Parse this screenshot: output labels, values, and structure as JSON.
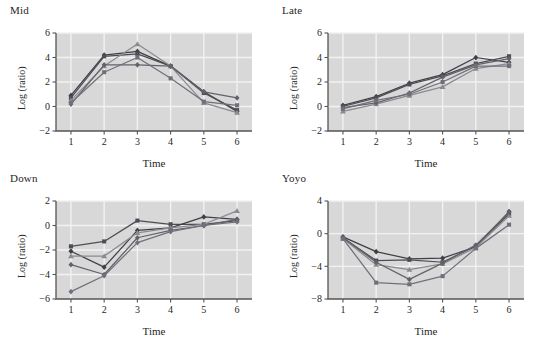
{
  "figure": {
    "background": "#ffffff",
    "plot_background": "#d8d8d8",
    "gridline_color": "#f2f2f2",
    "axis_color": "#555555",
    "text_color": "#262626"
  },
  "chart_data": [
    {
      "type": "line",
      "title": "Mid",
      "xlabel": "Time",
      "ylabel": "Log (ratio)",
      "grid": true,
      "legend": "none",
      "x": [
        1,
        2,
        3,
        4,
        5,
        6
      ],
      "xticklabels": [
        "1",
        "2",
        "3",
        "4",
        "5",
        "6"
      ],
      "yticklabels": [
        "-2",
        "0",
        "2",
        "4",
        "6"
      ],
      "yticks": [
        -2,
        0,
        2,
        4,
        6
      ],
      "xlim": [
        0.55,
        6.45
      ],
      "ylim": [
        -2,
        6
      ],
      "series": [
        {
          "name": "series-1",
          "marker": "diamond",
          "color": "#3f3f46",
          "values": [
            0.9,
            4.2,
            4.5,
            3.3,
            1.2,
            -0.4
          ]
        },
        {
          "name": "series-2",
          "marker": "square",
          "color": "#4d4d55",
          "values": [
            0.7,
            4.1,
            4.3,
            3.3,
            1.1,
            -0.3
          ]
        },
        {
          "name": "series-3",
          "marker": "triangle",
          "color": "#8a8a90",
          "values": [
            0.5,
            3.3,
            5.1,
            3.3,
            0.3,
            -0.5
          ]
        },
        {
          "name": "series-4",
          "marker": "diamond",
          "color": "#62626a",
          "values": [
            0.2,
            3.4,
            3.4,
            3.3,
            1.2,
            0.7
          ]
        },
        {
          "name": "series-5",
          "marker": "square",
          "color": "#70707a",
          "values": [
            0.3,
            2.8,
            4.0,
            2.3,
            0.4,
            0.1
          ]
        }
      ]
    },
    {
      "type": "line",
      "title": "Late",
      "xlabel": "Time",
      "ylabel": "Log (ratio)",
      "grid": true,
      "legend": "none",
      "x": [
        1,
        2,
        3,
        4,
        5,
        6
      ],
      "xticklabels": [
        "1",
        "2",
        "3",
        "4",
        "5",
        "6"
      ],
      "yticklabels": [
        "-2",
        "0",
        "2",
        "4",
        "6"
      ],
      "yticks": [
        -2,
        0,
        2,
        4,
        6
      ],
      "xlim": [
        0.55,
        6.45
      ],
      "ylim": [
        -2,
        6
      ],
      "series": [
        {
          "name": "series-1",
          "marker": "diamond",
          "color": "#3f3f46",
          "values": [
            0.1,
            0.8,
            1.9,
            2.6,
            4.0,
            3.6
          ]
        },
        {
          "name": "series-2",
          "marker": "square",
          "color": "#4d4d55",
          "values": [
            0.0,
            0.7,
            1.8,
            2.5,
            3.5,
            4.1
          ]
        },
        {
          "name": "series-3",
          "marker": "triangle",
          "color": "#8a8a90",
          "values": [
            -0.4,
            0.2,
            0.9,
            1.6,
            3.1,
            3.5
          ]
        },
        {
          "name": "series-4",
          "marker": "diamond",
          "color": "#62626a",
          "values": [
            -0.1,
            0.3,
            1.1,
            2.4,
            3.4,
            3.9
          ]
        },
        {
          "name": "series-5",
          "marker": "square",
          "color": "#70707a",
          "values": [
            -0.2,
            0.5,
            1.0,
            2.0,
            3.3,
            3.3
          ]
        }
      ]
    },
    {
      "type": "line",
      "title": "Down",
      "xlabel": "Time",
      "ylabel": "Log (ratio)",
      "grid": true,
      "legend": "none",
      "x": [
        1,
        2,
        3,
        4,
        5,
        6
      ],
      "xticklabels": [
        "1",
        "2",
        "3",
        "4",
        "5",
        "6"
      ],
      "yticklabels": [
        "-6",
        "-4",
        "-2",
        "0",
        "2"
      ],
      "yticks": [
        -6,
        -4,
        -2,
        0,
        2
      ],
      "xlim": [
        0.55,
        6.45
      ],
      "ylim": [
        -6,
        2
      ],
      "series": [
        {
          "name": "series-1",
          "marker": "square",
          "color": "#4d4d55",
          "values": [
            -1.7,
            -1.3,
            0.4,
            0.1,
            0.1,
            0.4
          ]
        },
        {
          "name": "series-2",
          "marker": "diamond",
          "color": "#3f3f46",
          "values": [
            -2.1,
            -3.4,
            -0.4,
            -0.2,
            0.7,
            0.5
          ]
        },
        {
          "name": "series-3",
          "marker": "triangle",
          "color": "#8a8a90",
          "values": [
            -2.5,
            -2.5,
            -0.6,
            -0.2,
            0.1,
            1.2
          ]
        },
        {
          "name": "series-4",
          "marker": "diamond",
          "color": "#62626a",
          "values": [
            -3.2,
            -4.0,
            -1.0,
            -0.4,
            0.0,
            0.5
          ]
        },
        {
          "name": "series-5",
          "marker": "diamond",
          "color": "#70707a",
          "values": [
            -5.4,
            -4.1,
            -1.4,
            -0.5,
            0.0,
            0.3
          ]
        }
      ]
    },
    {
      "type": "line",
      "title": "Yoyo",
      "xlabel": "Time",
      "ylabel": "Log (ratio)",
      "grid": true,
      "legend": "none",
      "x": [
        1,
        2,
        3,
        4,
        5,
        6
      ],
      "xticklabels": [
        "1",
        "2",
        "3",
        "4",
        "5",
        "6"
      ],
      "yticklabels": [
        "-8",
        "-4",
        "0",
        "4"
      ],
      "yticks": [
        -8,
        -4,
        0,
        4
      ],
      "xlim": [
        0.55,
        6.45
      ],
      "ylim": [
        -8,
        4
      ],
      "series": [
        {
          "name": "series-1",
          "marker": "diamond",
          "color": "#3f3f46",
          "values": [
            -0.4,
            -2.2,
            -3.1,
            -3.0,
            -1.6,
            2.7
          ]
        },
        {
          "name": "series-2",
          "marker": "square",
          "color": "#4d4d55",
          "values": [
            -0.5,
            -3.3,
            -3.2,
            -3.5,
            -1.5,
            2.4
          ]
        },
        {
          "name": "series-3",
          "marker": "triangle",
          "color": "#8a8a90",
          "values": [
            -0.6,
            -3.8,
            -4.4,
            -3.7,
            -1.7,
            2.2
          ]
        },
        {
          "name": "series-4",
          "marker": "diamond",
          "color": "#62626a",
          "values": [
            -0.5,
            -3.5,
            -5.6,
            -3.6,
            -1.4,
            2.6
          ]
        },
        {
          "name": "series-5",
          "marker": "square",
          "color": "#70707a",
          "values": [
            -0.6,
            -6.0,
            -6.2,
            -5.2,
            -1.8,
            1.1
          ]
        }
      ]
    }
  ],
  "panels": {
    "layout": [
      {
        "key": "mid",
        "left": 0,
        "top": 0
      },
      {
        "key": "late",
        "left": 272,
        "top": 0
      },
      {
        "key": "down",
        "left": 0,
        "top": 168
      },
      {
        "key": "yoyo",
        "left": 272,
        "top": 168
      }
    ]
  }
}
